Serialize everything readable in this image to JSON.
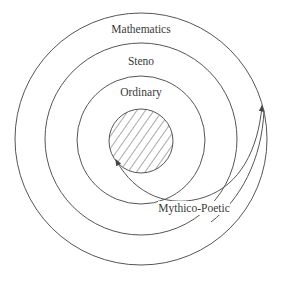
{
  "diagram": {
    "type": "concentric-circles",
    "center": [
      141,
      139
    ],
    "rings": [
      {
        "id": "mathematics",
        "label": "Mathematics",
        "radius": 126
      },
      {
        "id": "steno",
        "label": "Steno",
        "radius": 96
      },
      {
        "id": "ordinary",
        "label": "Ordinary",
        "radius": 64
      }
    ],
    "core": {
      "id": "core",
      "label": "",
      "radius": 32,
      "fill": "hatched"
    },
    "paths": [
      {
        "id": "mythico-poetic",
        "label": "Mythico-Poetic",
        "from": "core",
        "to": "mathematics",
        "arrowheads": "both"
      }
    ],
    "colors": {
      "line": "#555555",
      "text": "#3a3a3a",
      "background": "#ffffff"
    }
  },
  "labels": {
    "mathematics": "Mathematics",
    "steno": "Steno",
    "ordinary": "Ordinary",
    "mythico_poetic": "Mythico-Poetic"
  }
}
